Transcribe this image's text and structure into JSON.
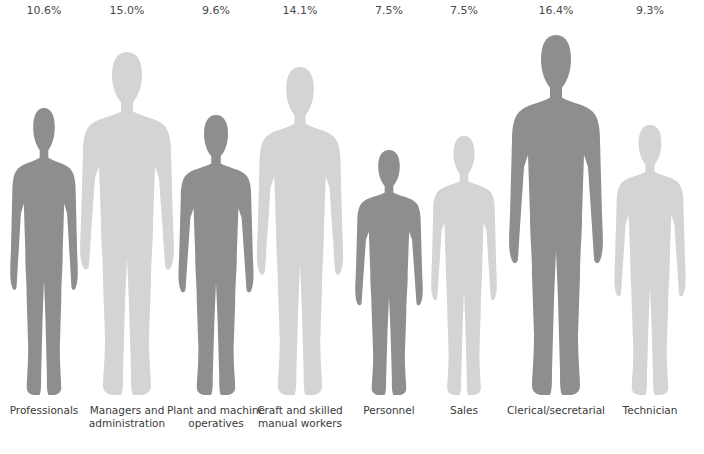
{
  "chart_data": {
    "type": "pictogram",
    "title": "",
    "categories": [
      "Professionals",
      "Managers and administration",
      "Plant and machine operatives",
      "Craft and skilled manual workers",
      "Personnel",
      "Sales",
      "Clerical/secretarial",
      "Technician"
    ],
    "values": [
      10.6,
      15.0,
      9.6,
      14.1,
      7.5,
      7.5,
      16.4,
      9.3
    ],
    "value_labels": [
      "10.6%",
      "15.0%",
      "9.6%",
      "14.1%",
      "7.5%",
      "7.5%",
      "16.4%",
      "9.3%"
    ],
    "unit": "%",
    "colors": {
      "dark": "#8e8e8e",
      "light": "#d4d4d4"
    }
  },
  "columns": [
    {
      "pct": "10.6%",
      "label": "Professionals",
      "shade": "dark",
      "x": 0,
      "top": 108,
      "w": 72
    },
    {
      "pct": "15.0%",
      "label": "Managers and administration",
      "shade": "light",
      "x": 83,
      "top": 52,
      "w": 100
    },
    {
      "pct": "9.6%",
      "label": "Plant and machine operatives",
      "shade": "dark",
      "x": 172,
      "top": 115,
      "w": 80
    },
    {
      "pct": "14.1%",
      "label": "Craft and skilled manual workers",
      "shade": "light",
      "x": 256,
      "top": 67,
      "w": 92
    },
    {
      "pct": "7.5%",
      "label": "Personnel",
      "shade": "dark",
      "x": 345,
      "top": 150,
      "w": 72
    },
    {
      "pct": "7.5%",
      "label": "Sales",
      "shade": "light",
      "x": 420,
      "top": 136,
      "w": 70
    },
    {
      "pct": "16.4%",
      "label": "Clerical/secretarial",
      "shade": "dark",
      "x": 512,
      "top": 35,
      "w": 100
    },
    {
      "pct": "9.3%",
      "label": "Technician",
      "shade": "light",
      "x": 606,
      "top": 125,
      "w": 76
    }
  ]
}
